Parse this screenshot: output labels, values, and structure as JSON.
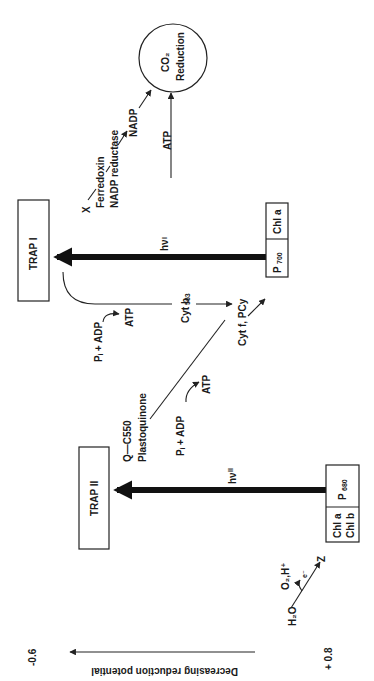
{
  "diagram": {
    "orientation": "rotated 90deg counter-clockwise",
    "axis": {
      "label": "Decreasing reduction potential",
      "top_value": "-0.6",
      "bottom_value": "+ 0.8"
    },
    "photosystem_ii": {
      "trap_label": "TRAP II",
      "reaction_center": "P",
      "reaction_center_sub": "680",
      "pigments_line1": "Chl a",
      "pigments_line2": "Chl b",
      "light_label": "hν",
      "light_sub": "II"
    },
    "photosystem_i": {
      "trap_label": "TRAP I",
      "reaction_center": "P",
      "reaction_center_sub": "700",
      "pigments": "Chl a",
      "light_label": "hν",
      "light_sub": "I"
    },
    "water_splitting": {
      "donor": "H₂O",
      "products": "O₂,H⁺",
      "electron": "e⁻",
      "acceptor": "Z"
    },
    "electron_carriers": {
      "q_line1": "Q—C550",
      "q_line2": "Plastoquinone",
      "cyt_f": "Cyt f, PCy",
      "cyt_b": "Cyt b",
      "cyt_b_sub": "563",
      "x": "X",
      "ferredoxin": "Ferredoxin",
      "nadp_reductase": "NADP reductase",
      "nadp": "NADP"
    },
    "phosphorylation": {
      "noncyclic_input": "Pᵢ + ADP",
      "noncyclic_output": "ATP",
      "cyclic_input": "Pᵢ + ADP",
      "cyclic_output": "ATP",
      "to_co2": "ATP"
    },
    "co2": {
      "line1": "CO₂",
      "line2": "Reduction"
    },
    "colors": {
      "ink": "#1a1a1a",
      "background": "#ffffff"
    }
  }
}
